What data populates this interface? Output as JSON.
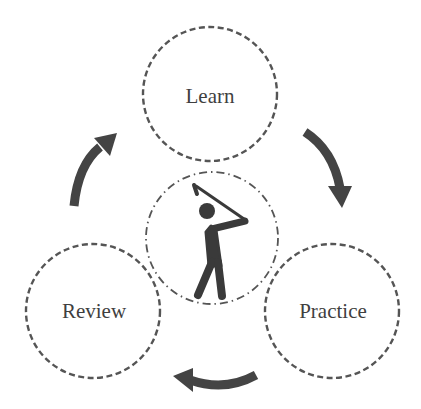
{
  "diagram": {
    "nodes": [
      {
        "id": "learn",
        "label": "Learn",
        "cx": 210,
        "cy": 94,
        "r": 67
      },
      {
        "id": "practice",
        "label": "Practice",
        "cx": 332,
        "cy": 311,
        "r": 67
      },
      {
        "id": "review",
        "label": "Review",
        "cx": 93,
        "cy": 311,
        "r": 67
      }
    ],
    "center": {
      "icon": "golfer-icon",
      "cx": 212,
      "cy": 238,
      "r": 66
    },
    "edges": [
      {
        "from": "learn",
        "to": "practice"
      },
      {
        "from": "practice",
        "to": "review"
      },
      {
        "from": "review",
        "to": "learn"
      }
    ],
    "colors": {
      "circle_stroke": "#555555",
      "arrow": "#444444",
      "icon": "#3a3a3a",
      "text": "#3f3f3f"
    }
  }
}
